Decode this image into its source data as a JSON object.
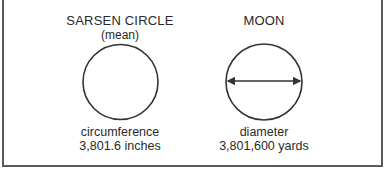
{
  "diagram": {
    "left": {
      "title": "SARSEN CIRCLE",
      "subtitle": "(mean)",
      "shape": "circle",
      "measure_label": "circumference",
      "measure_value": "3,801.6 inches"
    },
    "right": {
      "title": "MOON",
      "shape": "circle-with-diameter-arrow",
      "measure_label": "diameter",
      "measure_value": "3,801,600 yards"
    },
    "colors": {
      "stroke": "#333333",
      "frame": "#5a5a5a",
      "background": "#ffffff"
    }
  }
}
